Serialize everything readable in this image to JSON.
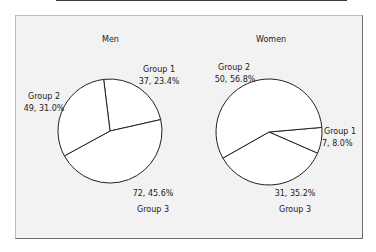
{
  "chart_data": [
    {
      "type": "pie",
      "title": "Men",
      "categories": [
        "Group 1",
        "Group 2",
        "Group 3"
      ],
      "values": [
        37,
        49,
        72
      ],
      "percentages": [
        23.4,
        31.0,
        45.6
      ],
      "labels": [
        "37, 23.4%",
        "49, 31.0%",
        "72, 45.6%"
      ]
    },
    {
      "type": "pie",
      "title": "Women",
      "categories": [
        "Group 1",
        "Group 2",
        "Group 3"
      ],
      "values": [
        7,
        50,
        31
      ],
      "percentages": [
        8.0,
        56.8,
        35.2
      ],
      "labels": [
        "7, 8.0%",
        "50, 56.8%",
        "31, 35.2%"
      ]
    }
  ],
  "colors": {
    "slice_fill": "#ffffff",
    "slice_stroke": "#222222",
    "background": "#f2f2f2"
  }
}
